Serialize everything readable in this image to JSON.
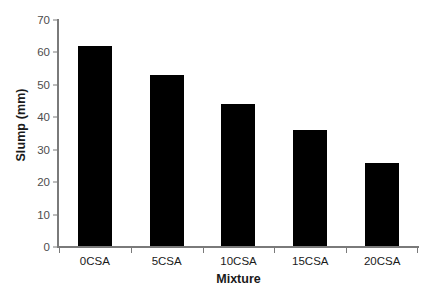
{
  "chart_data": {
    "type": "bar",
    "title": "",
    "subtitle": "",
    "xlabel": "Mixture",
    "ylabel": "Slump (mm)",
    "categories": [
      "0CSA",
      "5CSA",
      "10CSA",
      "15CSA",
      "20CSA"
    ],
    "values": [
      62,
      53,
      44,
      36,
      26
    ],
    "series": [
      {
        "name": "Slump",
        "values": [
          62,
          53,
          44,
          36,
          26
        ]
      }
    ],
    "ylim": [
      0,
      70
    ],
    "ytick_labels": [
      "0",
      "10",
      "20",
      "30",
      "40",
      "50",
      "60",
      "70"
    ],
    "ytick_values": [
      0,
      10,
      20,
      30,
      40,
      50,
      60,
      70
    ],
    "grid": false,
    "legend": "none",
    "bar_color": "#000000",
    "axis_color": "#7a7a7a",
    "tick_label_color": "#4d4d4d",
    "background_color": "#ffffff"
  }
}
